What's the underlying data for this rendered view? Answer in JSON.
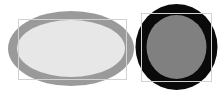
{
  "canvas": {
    "width": 224,
    "height": 93,
    "background_color": "#ffffff",
    "title": "Shape Segmentation Result"
  },
  "palette": {
    "background": "#ffffff",
    "light_fill": "#e7e7e7",
    "ring_gray": "#9a9a9a",
    "mid_gray": "#808080",
    "ring_black": "#0a0a0a",
    "bbox_stroke": "#d2d2d2"
  },
  "objects": [
    {
      "id": "ellipse-object",
      "name": "light-gray-ellipse",
      "shape": "ellipse",
      "center_x": 71,
      "center_y": 48.5,
      "radius_x": 63,
      "radius_y": 37.5,
      "ring_thickness": 9,
      "ring_color": "#9a9a9a",
      "fill_color": "#e7e7e7",
      "bbox": {
        "x": 18.5,
        "y": 19.5,
        "width": 108,
        "height": 60
      },
      "bbox_stroke": "#d2d2d2",
      "bbox_stroke_width": 1
    },
    {
      "id": "circle-object",
      "name": "black-ring-circle",
      "shape": "circle",
      "center_x": 176.5,
      "center_y": 47,
      "radius_x": 41,
      "radius_y": 43,
      "ring_thickness": 11,
      "ring_color": "#0a0a0a",
      "fill_color": "#808080",
      "bbox": {
        "x": 141.5,
        "y": 13.5,
        "width": 70,
        "height": 68
      },
      "bbox_stroke": "#d2d2d2",
      "bbox_stroke_width": 1
    }
  ],
  "chart_data": {
    "type": "scatter",
    "xlabel": "",
    "ylabel": "",
    "categories": [
      "light-gray-ellipse",
      "black-ring-circle"
    ],
    "values": [
      {
        "label": "light-gray-ellipse",
        "cx": 71,
        "cy": 48.5,
        "rx": 63,
        "ry": 37.5,
        "ring_px": 9,
        "ring_color": "#9a9a9a",
        "fill_color": "#e7e7e7",
        "bbox": [
          18.5,
          19.5,
          108,
          60
        ]
      },
      {
        "label": "black-ring-circle",
        "cx": 176.5,
        "cy": 47,
        "rx": 41,
        "ry": 43,
        "ring_px": 11,
        "ring_color": "#0a0a0a",
        "fill_color": "#808080",
        "bbox": [
          141.5,
          13.5,
          70,
          68
        ]
      }
    ]
  }
}
